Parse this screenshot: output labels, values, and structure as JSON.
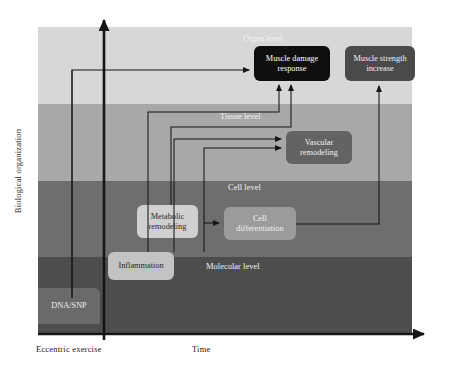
{
  "figure": {
    "type": "diagram",
    "axes": {
      "y_label": "Biological organization",
      "x_label": "Time",
      "x_origin_label": "Eccentric exercise"
    },
    "levels": [
      {
        "id": "organ",
        "label": "Organ level",
        "color": "#d7d7d7",
        "label_x": 205,
        "label_y": 6
      },
      {
        "id": "tissue",
        "label": "Tissue level",
        "color": "#a8a8a8",
        "label_x": 182,
        "label_y": 84
      },
      {
        "id": "cell",
        "label": "Cell level",
        "color": "#6e6e6e",
        "label_x": 190,
        "label_y": 155
      },
      {
        "id": "molecular",
        "label": "Molecular level",
        "color": "#4d4d4d",
        "label_x": 168,
        "label_y": 234
      }
    ],
    "nodes": [
      {
        "id": "dna",
        "label": "DNA/SNP",
        "lines": [
          "DNA/SNP"
        ],
        "fill": "#6a6a6a",
        "text": "#f0f0f0",
        "x": 38,
        "y": 288,
        "w": 62,
        "h": 36
      },
      {
        "id": "inflammation",
        "label": "Inflammation",
        "lines": [
          "Inflammation"
        ],
        "fill": "#c3c3c3",
        "text": "#2a2a2a",
        "x": 108,
        "y": 252,
        "w": 66,
        "h": 28
      },
      {
        "id": "metabolic",
        "label": "Metabolic remodeling",
        "lines": [
          "Metabolic",
          "remodeling"
        ],
        "fill": "#d0d0d0",
        "text": "#2a2a2a",
        "x": 137,
        "y": 205,
        "w": 61,
        "h": 33
      },
      {
        "id": "celldiff",
        "label": "Cell differentiation",
        "lines": [
          "Cell",
          "differentiation"
        ],
        "fill": "#9b9b9b",
        "text": "#f2f2f2",
        "x": 224,
        "y": 207,
        "w": 72,
        "h": 33
      },
      {
        "id": "vascular",
        "label": "Vascular remodeling",
        "lines": [
          "Vascular",
          "remodeling"
        ],
        "fill": "#636363",
        "text": "#f2f2f2",
        "x": 286,
        "y": 131,
        "w": 66,
        "h": 33
      },
      {
        "id": "damage",
        "label": "Muscle damage response",
        "lines": [
          "Muscle damage",
          "response"
        ],
        "fill": "#0f0f0f",
        "text": "#ffffff",
        "x": 254,
        "y": 46,
        "w": 76,
        "h": 35
      },
      {
        "id": "strength",
        "label": "Muscle strength increase",
        "lines": [
          "Muscle strength",
          "increase"
        ],
        "fill": "#4a4a4a",
        "text": "#f2f2f2",
        "x": 345,
        "y": 46,
        "w": 70,
        "h": 35
      }
    ],
    "edges": [
      {
        "id": "dna-to-damage",
        "from": "dna",
        "to": "damage"
      },
      {
        "id": "dna-to-metabolic",
        "from": "dna",
        "to": "metabolic"
      },
      {
        "id": "inflammation-to-damage",
        "from": "inflammation",
        "to": "damage"
      },
      {
        "id": "inflammation-to-vascular",
        "from": "inflammation",
        "to": "vascular"
      },
      {
        "id": "metabolic-to-vascular",
        "from": "metabolic",
        "to": "vascular"
      },
      {
        "id": "metabolic-to-celldiff",
        "from": "metabolic",
        "to": "celldiff"
      },
      {
        "id": "vascular-to-damage",
        "from": "vascular",
        "to": "damage"
      },
      {
        "id": "celldiff-to-strength",
        "from": "celldiff",
        "to": "strength"
      }
    ]
  }
}
